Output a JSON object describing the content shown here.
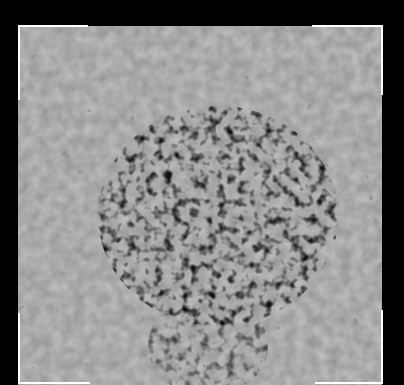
{
  "image": {
    "description": "Grayscale mottled noise texture with a dark irregular cluster near the center, framed by white corner brackets on a black background",
    "background_color": "#000000",
    "texture_base_color": "#8f8f8f",
    "dark_color": "#0a0a0a",
    "light_color": "#d8d8d8",
    "bracket_color": "#ffffff"
  }
}
